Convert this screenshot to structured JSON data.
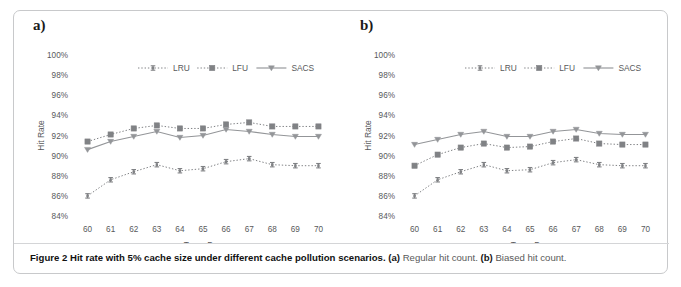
{
  "figure": {
    "caption_figure_number": "Figure 2",
    "caption_title": " Hit rate with 5% cache size under different cache pollution scenarios. ",
    "caption_a_label": "(a)",
    "caption_a_text": " Regular hit count. ",
    "caption_b_label": "(b)",
    "caption_b_text": " Biased hit count.",
    "border_color": "#c8c9cb",
    "background_color": "#ffffff"
  },
  "panels": [
    {
      "label": "a)",
      "name": "panel-a-regular-hit-count"
    },
    {
      "label": "b)",
      "name": "panel-b-biased-hit-count"
    }
  ],
  "legend": {
    "position": "top-center",
    "entries": [
      {
        "label": "LRU",
        "marker": "errorbar",
        "line": "dotted",
        "color": "#808285"
      },
      {
        "label": "LFU",
        "marker": "square",
        "line": "dotted",
        "color": "#808285"
      },
      {
        "label": "SACS",
        "marker": "triangle",
        "line": "solid",
        "color": "#939598"
      }
    ]
  },
  "chart_data": [
    {
      "type": "line",
      "panel": "a",
      "title": "",
      "subtitle": "Regular hit count",
      "xlabel": "Trace Day",
      "ylabel": "Hit Rate",
      "x": [
        60,
        61,
        62,
        63,
        64,
        65,
        66,
        67,
        68,
        69,
        70
      ],
      "categories": [
        "60",
        "61",
        "62",
        "63",
        "64",
        "65",
        "66",
        "67",
        "68",
        "69",
        "70"
      ],
      "xlim": [
        59.5,
        70.5
      ],
      "ylim": [
        84,
        100
      ],
      "yticks": [
        84,
        86,
        88,
        90,
        92,
        94,
        96,
        98,
        100
      ],
      "ytick_labels": [
        "84%",
        "86%",
        "88%",
        "90%",
        "92%",
        "94%",
        "96%",
        "98%",
        "100%"
      ],
      "grid": false,
      "legend": [
        "LRU",
        "LFU",
        "SACS"
      ],
      "series": [
        {
          "name": "LRU",
          "marker": "errorbar",
          "line": "dotted",
          "color": "#808285",
          "values": [
            86.0,
            87.6,
            88.4,
            89.1,
            88.5,
            88.7,
            89.4,
            89.7,
            89.1,
            89.0,
            89.0
          ],
          "errors": [
            0.22,
            0.2,
            0.2,
            0.22,
            0.2,
            0.18,
            0.2,
            0.2,
            0.18,
            0.18,
            0.18
          ]
        },
        {
          "name": "LFU",
          "marker": "square",
          "line": "dotted",
          "color": "#808285",
          "values": [
            91.4,
            92.1,
            92.7,
            93.0,
            92.7,
            92.7,
            93.1,
            93.3,
            92.9,
            92.9,
            92.9
          ],
          "errors": [
            0.0,
            0.0,
            0.0,
            0.0,
            0.0,
            0.0,
            0.0,
            0.0,
            0.0,
            0.0,
            0.0
          ]
        },
        {
          "name": "SACS",
          "marker": "triangle",
          "line": "solid",
          "color": "#939598",
          "values": [
            90.6,
            91.4,
            91.9,
            92.4,
            91.8,
            92.0,
            92.6,
            92.4,
            92.1,
            91.9,
            91.9
          ],
          "errors": [
            0.0,
            0.0,
            0.0,
            0.0,
            0.0,
            0.0,
            0.0,
            0.0,
            0.0,
            0.0,
            0.0
          ]
        }
      ]
    },
    {
      "type": "line",
      "panel": "b",
      "title": "",
      "subtitle": "Biased hit count",
      "xlabel": "Trace Day",
      "ylabel": "Hit Rate",
      "x": [
        60,
        61,
        62,
        63,
        64,
        65,
        66,
        67,
        68,
        69,
        70
      ],
      "categories": [
        "60",
        "61",
        "62",
        "63",
        "64",
        "65",
        "66",
        "67",
        "68",
        "69",
        "70"
      ],
      "xlim": [
        59.5,
        70.5
      ],
      "ylim": [
        84,
        100
      ],
      "yticks": [
        84,
        86,
        88,
        90,
        92,
        94,
        96,
        98,
        100
      ],
      "ytick_labels": [
        "84%",
        "86%",
        "88%",
        "90%",
        "92%",
        "94%",
        "96%",
        "98%",
        "100%"
      ],
      "grid": false,
      "legend": [
        "LRU",
        "LFU",
        "SACS"
      ],
      "series": [
        {
          "name": "LRU",
          "marker": "errorbar",
          "line": "dotted",
          "color": "#808285",
          "values": [
            86.0,
            87.6,
            88.4,
            89.1,
            88.5,
            88.6,
            89.3,
            89.6,
            89.1,
            89.0,
            89.0
          ],
          "errors": [
            0.22,
            0.2,
            0.2,
            0.22,
            0.2,
            0.18,
            0.2,
            0.2,
            0.18,
            0.18,
            0.18
          ]
        },
        {
          "name": "LFU",
          "marker": "square",
          "line": "dotted",
          "color": "#808285",
          "values": [
            89.0,
            90.1,
            90.8,
            91.2,
            90.8,
            90.9,
            91.4,
            91.7,
            91.2,
            91.1,
            91.1
          ],
          "errors": [
            0.0,
            0.0,
            0.0,
            0.0,
            0.0,
            0.0,
            0.0,
            0.0,
            0.0,
            0.0,
            0.0
          ]
        },
        {
          "name": "SACS",
          "marker": "triangle",
          "line": "solid",
          "color": "#939598",
          "values": [
            91.1,
            91.6,
            92.1,
            92.4,
            91.9,
            91.9,
            92.4,
            92.6,
            92.2,
            92.1,
            92.1
          ],
          "errors": [
            0.0,
            0.0,
            0.0,
            0.0,
            0.0,
            0.0,
            0.0,
            0.0,
            0.0,
            0.0,
            0.0
          ]
        }
      ]
    }
  ]
}
